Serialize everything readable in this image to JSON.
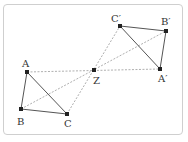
{
  "diagram": {
    "type": "point-reflection",
    "colors": {
      "line": "#555555",
      "dashed": "#9a9a9a",
      "point": "#222222",
      "frame": "#cfcfcf",
      "label": "#333333"
    },
    "center": {
      "label": "Z",
      "x": 94,
      "y": 70,
      "lx": 93,
      "ly": 84
    },
    "original": [
      {
        "label": "A",
        "x": 27,
        "y": 72,
        "lx": 22,
        "ly": 67
      },
      {
        "label": "B",
        "x": 21,
        "y": 109,
        "lx": 17,
        "ly": 125
      },
      {
        "label": "C",
        "x": 67,
        "y": 114,
        "lx": 64,
        "ly": 127
      }
    ],
    "image": [
      {
        "label": "A′",
        "x": 160,
        "y": 69,
        "lx": 158,
        "ly": 82
      },
      {
        "label": "B′",
        "x": 166,
        "y": 31,
        "lx": 161,
        "ly": 25
      },
      {
        "label": "C′",
        "x": 120,
        "y": 26,
        "lx": 111,
        "ly": 22
      }
    ]
  }
}
